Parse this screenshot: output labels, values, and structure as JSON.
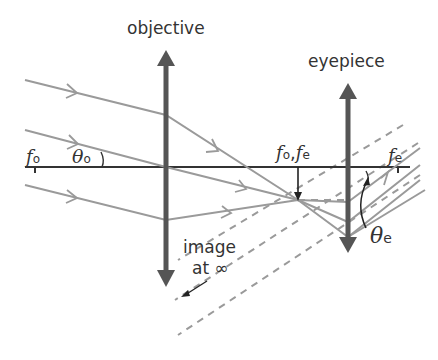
{
  "diagram": {
    "labels": {
      "objective": "objective",
      "eyepiece": "eyepiece",
      "image_line1": "image",
      "image_line2": "at ∞",
      "f_o_left": {
        "symbol": "f",
        "sub": "o"
      },
      "theta_o": {
        "symbol": "θ",
        "sub": "o"
      },
      "f_o_f_e": {
        "symbol1": "f",
        "sub1": "o",
        "sep": ",",
        "symbol2": "f",
        "sub2": "e"
      },
      "f_e_right": {
        "symbol": "f",
        "sub": "e"
      },
      "theta_e": {
        "symbol": "θ",
        "sub": "e"
      }
    },
    "colors": {
      "lens": "#555555",
      "axis": "#333333",
      "ray": "#999999",
      "dashed": "#999999",
      "text": "#333333"
    }
  }
}
